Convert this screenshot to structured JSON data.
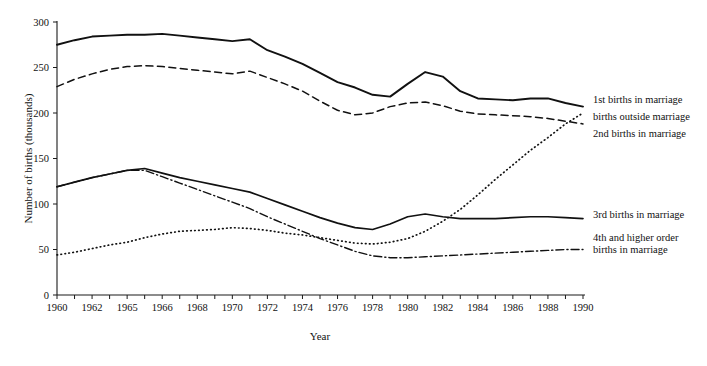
{
  "chart_data": {
    "type": "line",
    "title": "",
    "xlabel": "Year",
    "ylabel": "Number of births (thousands)",
    "xlim": [
      1960,
      1990
    ],
    "ylim": [
      0,
      300
    ],
    "ytick_step": 50,
    "grid": false,
    "legend_position": "right-inline-annotations",
    "x": [
      1960,
      1961,
      1962,
      1963,
      1964,
      1965,
      1966,
      1967,
      1968,
      1969,
      1970,
      1971,
      1972,
      1973,
      1974,
      1975,
      1976,
      1977,
      1978,
      1979,
      1980,
      1981,
      1982,
      1983,
      1984,
      1985,
      1986,
      1987,
      1988,
      1989,
      1990
    ],
    "xtick_labels": [
      "1960",
      "1962",
      "1965",
      "1966",
      "1968",
      "1970",
      "1972",
      "1974",
      "1976",
      "1978",
      "1980",
      "1982",
      "1984",
      "1986",
      "1988",
      "1990"
    ],
    "xtick_label_years": [
      1960,
      1962,
      1964,
      1966,
      1968,
      1970,
      1972,
      1974,
      1976,
      1978,
      1980,
      1982,
      1984,
      1986,
      1988,
      1990
    ],
    "ytick_labels": [
      "0",
      "50",
      "100",
      "150",
      "200",
      "250",
      "300"
    ],
    "ytick_values": [
      0,
      50,
      100,
      150,
      200,
      250,
      300
    ],
    "series": [
      {
        "name": "1st births in marriage",
        "style": "solid",
        "label_x": 1990.4,
        "label_y": 215,
        "values": [
          275,
          280,
          284,
          285,
          286,
          286,
          287,
          285,
          283,
          281,
          279,
          281,
          269,
          262,
          254,
          244,
          234,
          228,
          220,
          218,
          232,
          245,
          240,
          224,
          216,
          215,
          214,
          216,
          216,
          211,
          207
        ]
      },
      {
        "name": "births outside marriage",
        "style": "dotted",
        "label_x": 1990.4,
        "label_y": 196,
        "values": [
          44,
          47,
          51,
          55,
          58,
          63,
          67,
          70,
          71,
          72,
          74,
          73,
          71,
          68,
          66,
          63,
          60,
          57,
          56,
          58,
          62,
          70,
          81,
          94,
          110,
          127,
          143,
          159,
          173,
          188,
          200
        ]
      },
      {
        "name": "2nd births in marriage",
        "style": "dashed",
        "label_x": 1990.4,
        "label_y": 178,
        "values": [
          229,
          237,
          243,
          248,
          251,
          252,
          251,
          249,
          247,
          245,
          243,
          246,
          239,
          232,
          224,
          213,
          203,
          198,
          200,
          207,
          211,
          212,
          208,
          202,
          199,
          198,
          197,
          196,
          194,
          191,
          188
        ]
      },
      {
        "name": "3rd births in marriage",
        "style": "solid-thin",
        "label_x": 1990.4,
        "label_y": 89,
        "values": [
          119,
          124,
          129,
          133,
          137,
          139,
          134,
          129,
          125,
          121,
          117,
          113,
          106,
          99,
          92,
          85,
          79,
          74,
          72,
          78,
          86,
          89,
          86,
          84,
          84,
          84,
          85,
          86,
          86,
          85,
          84
        ]
      },
      {
        "name": "4th and higher order births in marriage",
        "style": "dash-dot",
        "label_lines": [
          "4th and higher order",
          "births in marriage"
        ],
        "label_x": 1990.4,
        "label_y": 55,
        "values": [
          119,
          124,
          129,
          133,
          137,
          137,
          130,
          123,
          116,
          109,
          102,
          95,
          86,
          78,
          70,
          62,
          55,
          48,
          43,
          41,
          41,
          42,
          43,
          44,
          45,
          46,
          47,
          48,
          49,
          50,
          50
        ]
      }
    ],
    "annotations": [
      {
        "id": "annot-1st",
        "text": "1st births in marriage"
      },
      {
        "id": "annot-outside",
        "text": "births outside marriage"
      },
      {
        "id": "annot-2nd",
        "text": "2nd births in marriage"
      },
      {
        "id": "annot-3rd",
        "text": "3rd births in marriage"
      },
      {
        "id": "annot-4th-line1",
        "text": "4th and higher order"
      },
      {
        "id": "annot-4th-line2",
        "text": "births in marriage"
      }
    ],
    "colors": {
      "ink": "#111111",
      "background": "#ffffff"
    }
  },
  "axes": {
    "x_title": "Year",
    "y_title": "Number of births (thousands)",
    "y_ticks": [
      "300",
      "250",
      "200",
      "150",
      "100",
      "50",
      "0"
    ],
    "x_ticks": [
      "1960",
      "1962",
      "1965",
      "1966",
      "1968",
      "1970",
      "1972",
      "1974",
      "1976",
      "1978",
      "1980",
      "1982",
      "1984",
      "1986",
      "1988",
      "1990"
    ]
  },
  "labels": {
    "first_births": "1st births in marriage",
    "outside_marriage": "births outside marriage",
    "second_births": "2nd births in marriage",
    "third_births": "3rd births in marriage",
    "fourth_births_l1": "4th and higher order",
    "fourth_births_l2": "births in marriage"
  }
}
